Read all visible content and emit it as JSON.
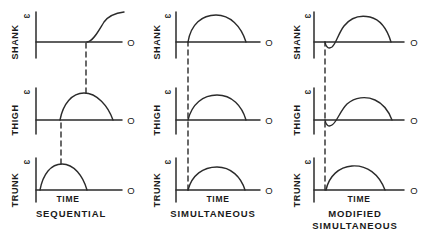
{
  "figure": {
    "background_color": "#ffffff",
    "line_color": "#2b2b2b",
    "dashed_color": "#2b2b2b"
  },
  "axis_labels": {
    "time": "TIME",
    "origin_marker": "O",
    "omega": "ω"
  },
  "row_labels": {
    "shank": "SHANK",
    "thigh": "THIGH",
    "trunk": "TRUNK"
  },
  "panels": [
    {
      "id": "sequential",
      "caption_lines": [
        "SEQUENTIAL"
      ],
      "rows": [
        {
          "segment": "SHANK",
          "label": "SHANK",
          "omega": "ω",
          "time_label": "",
          "origin_marker": "O",
          "curve_type": "rising-open",
          "onset_fraction": 0.58,
          "peak_fraction": 1.0,
          "peak_height": 0.95,
          "has_dip": false
        },
        {
          "segment": "THIGH",
          "label": "THIGH",
          "omega": "ω",
          "time_label": "",
          "origin_marker": "O",
          "curve_type": "arch",
          "onset_fraction": 0.28,
          "offset_fraction": 0.92,
          "peak_fraction": 0.6,
          "peak_height": 0.8,
          "has_dip": false
        },
        {
          "segment": "TRUNK",
          "label": "TRUNK",
          "omega": "ω",
          "time_label": "TIME",
          "origin_marker": "O",
          "curve_type": "arch",
          "onset_fraction": 0.05,
          "offset_fraction": 0.65,
          "peak_fraction": 0.3,
          "peak_height": 0.75,
          "has_dip": false
        }
      ],
      "dashed_links": [
        {
          "from_row": "TRUNK",
          "to_row": "THIGH",
          "x_fraction": 0.28
        },
        {
          "from_row": "THIGH",
          "to_row": "SHANK",
          "x_fraction": 0.58
        }
      ]
    },
    {
      "id": "simultaneous",
      "caption_lines": [
        "SIMULTANEOUS"
      ],
      "rows": [
        {
          "segment": "SHANK",
          "label": "SHANK",
          "omega": "ω",
          "time_label": "",
          "origin_marker": "O",
          "curve_type": "arch",
          "onset_fraction": 0.14,
          "offset_fraction": 0.86,
          "peak_fraction": 0.48,
          "peak_height": 0.92,
          "has_dip": false
        },
        {
          "segment": "THIGH",
          "label": "THIGH",
          "omega": "ω",
          "time_label": "",
          "origin_marker": "O",
          "curve_type": "arch",
          "onset_fraction": 0.14,
          "offset_fraction": 0.86,
          "peak_fraction": 0.5,
          "peak_height": 0.72,
          "has_dip": false
        },
        {
          "segment": "TRUNK",
          "label": "TRUNK",
          "omega": "ω",
          "time_label": "TIME",
          "origin_marker": "O",
          "curve_type": "arch",
          "onset_fraction": 0.14,
          "offset_fraction": 0.86,
          "peak_fraction": 0.5,
          "peak_height": 0.62,
          "has_dip": false
        }
      ],
      "dashed_links": [
        {
          "from_row": "TRUNK",
          "to_row": "SHANK",
          "x_fraction": 0.14
        }
      ]
    },
    {
      "id": "modified-simultaneous",
      "caption_lines": [
        "MODIFIED",
        "SIMULTANEOUS"
      ],
      "rows": [
        {
          "segment": "SHANK",
          "label": "SHANK",
          "omega": "ω",
          "time_label": "",
          "origin_marker": "O",
          "curve_type": "arch-with-dip",
          "onset_fraction": 0.14,
          "offset_fraction": 0.92,
          "peak_fraction": 0.52,
          "peak_height": 0.9,
          "has_dip": true,
          "dip_depth": 0.1,
          "dip_end_fraction": 0.24
        },
        {
          "segment": "THIGH",
          "label": "THIGH",
          "omega": "ω",
          "time_label": "",
          "origin_marker": "O",
          "curve_type": "arch-with-dip",
          "onset_fraction": 0.14,
          "offset_fraction": 0.92,
          "peak_fraction": 0.54,
          "peak_height": 0.76,
          "has_dip": true,
          "dip_depth": 0.09,
          "dip_end_fraction": 0.24
        },
        {
          "segment": "TRUNK",
          "label": "TRUNK",
          "omega": "ω",
          "time_label": "TIME",
          "origin_marker": "O",
          "curve_type": "arch",
          "onset_fraction": 0.14,
          "offset_fraction": 0.92,
          "peak_fraction": 0.52,
          "peak_height": 0.74,
          "has_dip": false
        }
      ],
      "dashed_links": [
        {
          "from_row": "TRUNK",
          "to_row": "SHANK",
          "x_fraction": 0.14
        }
      ]
    }
  ]
}
